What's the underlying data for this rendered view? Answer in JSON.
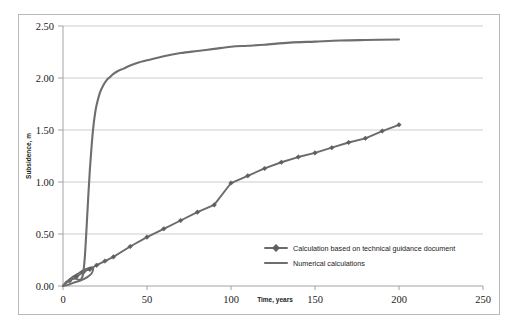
{
  "chart_data": {
    "type": "line",
    "title": "",
    "xlabel": "Time, years",
    "ylabel": "Subsidence, m",
    "xlim": [
      0,
      250
    ],
    "ylim": [
      0,
      2.5
    ],
    "xticks": [
      0,
      50,
      100,
      150,
      200,
      250
    ],
    "xtick_labels": [
      "0",
      "50",
      "100",
      "150",
      "200",
      "250"
    ],
    "yticks": [
      0.0,
      0.5,
      1.0,
      1.5,
      2.0,
      2.5
    ],
    "ytick_labels": [
      "0.00",
      "0.50",
      "1.00",
      "1.50",
      "2.00",
      "2.50"
    ],
    "grid": "horizontal",
    "legend_position": "inside-lower-right",
    "series": [
      {
        "name": "Calculation based on technical guidance document",
        "marker": "diamond",
        "color": "#5f5f5f",
        "x": [
          0,
          2,
          4,
          6,
          8,
          10,
          12,
          14,
          16,
          18,
          20,
          25,
          30,
          40,
          50,
          60,
          70,
          80,
          90,
          100,
          110,
          120,
          130,
          140,
          150,
          160,
          170,
          180,
          190,
          200
        ],
        "y": [
          0.0,
          0.03,
          0.05,
          0.07,
          0.09,
          0.11,
          0.13,
          0.15,
          0.16,
          0.18,
          0.2,
          0.24,
          0.28,
          0.38,
          0.47,
          0.55,
          0.63,
          0.71,
          0.78,
          0.99,
          1.06,
          1.13,
          1.19,
          1.24,
          1.28,
          1.33,
          1.38,
          1.42,
          1.49,
          1.55
        ]
      },
      {
        "name": "Numerical calculations",
        "marker": "none",
        "color": "#6e6e6e",
        "x": [
          0,
          1,
          2,
          3,
          4,
          5,
          6,
          7,
          8,
          9,
          10,
          11,
          12,
          13,
          14,
          15,
          16,
          17,
          18,
          19,
          20,
          22,
          24,
          26,
          28,
          30,
          33,
          36,
          40,
          45,
          50,
          60,
          70,
          80,
          90,
          100,
          110,
          120,
          135,
          150,
          165,
          180,
          200
        ],
        "y": [
          0.0,
          0.02,
          0.04,
          0.05,
          0.06,
          0.07,
          0.07,
          0.07,
          0.07,
          0.06,
          0.06,
          0.07,
          0.12,
          0.28,
          0.55,
          0.85,
          1.12,
          1.34,
          1.52,
          1.65,
          1.74,
          1.86,
          1.93,
          1.98,
          2.01,
          2.04,
          2.07,
          2.09,
          2.12,
          2.15,
          2.17,
          2.21,
          2.24,
          2.26,
          2.28,
          2.3,
          2.31,
          2.32,
          2.34,
          2.35,
          2.36,
          2.365,
          2.37
        ]
      }
    ],
    "back_lobe": {
      "note": "small initial lobe near origin where both curves overlap",
      "x": [
        0,
        3,
        6,
        9,
        12,
        15,
        17,
        18,
        17,
        14,
        10,
        6,
        3,
        0
      ],
      "y": [
        0.0,
        0.05,
        0.09,
        0.12,
        0.15,
        0.17,
        0.18,
        0.17,
        0.12,
        0.08,
        0.05,
        0.03,
        0.01,
        0.0
      ]
    }
  },
  "legend": {
    "entries": [
      {
        "label": "Calculation based on technical guidance document",
        "marker": "diamond"
      },
      {
        "label": "Numerical calculations",
        "marker": "none"
      }
    ]
  },
  "axes": {
    "x_title": "Time, years",
    "y_title": "Subsidence, m"
  }
}
